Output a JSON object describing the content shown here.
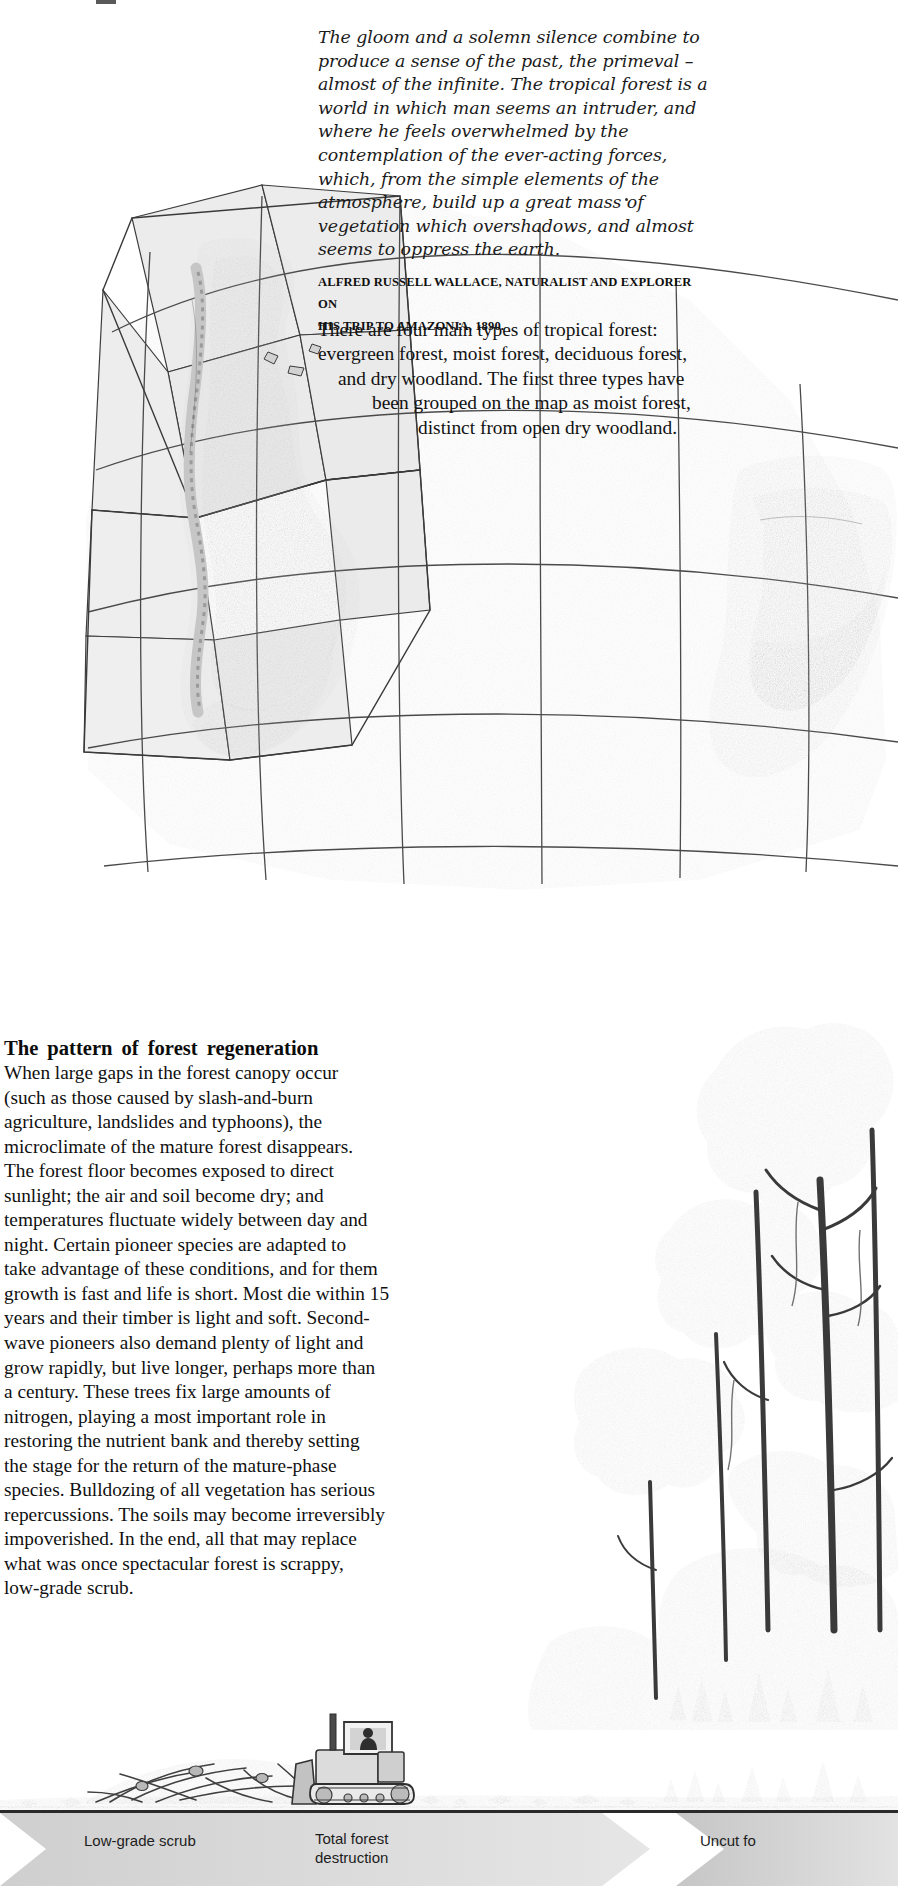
{
  "page": {
    "width": 898,
    "height": 1886,
    "background": "#ffffff"
  },
  "quote": {
    "text": "The gloom and a solemn silence combine to produce a sense of the past, the primeval – almost of the infinite. The tropical forest is a world in which man seems an intruder, and where he feels overwhelmed by the contemplation of the ever-acting forces, which, from the simple elements of the atmosphere, build up a great mass of vegetation which overshadows, and almost seems to oppress the earth.",
    "attribution_line1": "ALFRED RUSSELL WALLACE, NATURALIST AND EXPLORER ON",
    "attribution_line2": "HIS TRIP TO AMAZONIA, 1890."
  },
  "forest_types": {
    "line1": "There are four main types of tropical forest:",
    "line2": "evergreen forest, moist forest, deciduous forest,",
    "line3": "and dry woodland. The first three types have",
    "line4": "been grouped on the map as moist forest,",
    "line5": "distinct from open dry woodland."
  },
  "article": {
    "heading_words": [
      "The",
      "pattern",
      "of",
      "forest",
      "regeneration"
    ],
    "heading": "The pattern of forest regeneration",
    "body_lines": [
      "When large gaps in the forest canopy occur",
      "(such as those caused by slash-and-burn",
      "agriculture, landslides and typhoons), the",
      "microclimate of the mature forest disappears.",
      "The forest floor becomes exposed to direct",
      "sunlight; the air and soil become dry; and",
      "temperatures fluctuate widely between day and",
      "night. Certain pioneer species are adapted to",
      "take advantage of these conditions, and for them",
      "growth is fast and life is short. Most die within 15",
      "years and their timber is light and soft. Second-",
      "wave pioneers also demand plenty of light and",
      "grow rapidly, but live longer, perhaps more than",
      "a century. These trees fix large amounts of",
      "nitrogen, playing a most important role in",
      "restoring the nutrient bank and thereby setting",
      "the stage for the return of the mature-phase",
      "species. Bulldozing of all vegetation has serious",
      "repercussions. The soils may become irreversibly",
      "impoverished. In the end, all that may replace",
      "what was once spectacular forest is scrappy,",
      "low-grade scrub."
    ]
  },
  "caption_band": {
    "labels": {
      "low_grade_scrub": "Low-grade scrub",
      "total_forest_destruction_line1": "Total forest",
      "total_forest_destruction_line2": "destruction",
      "uncut_forest": "Uncut fo"
    }
  },
  "illustration": {
    "map_name": "tropical-forest-world-map",
    "trees_name": "rainforest-trees-illustration",
    "scene_name": "bulldozer-clearing-scene"
  },
  "colors": {
    "paper": "#ffffff",
    "map_ocean": "#ffffff",
    "map_land_light": "#e4e4e4",
    "map_land_mid": "#c9c9c9",
    "moist_forest": "#9c9c9c",
    "dry_woodland": "#bdbdbd",
    "graticule": "#4a4a4a",
    "text": "#101010",
    "band_rule": "#2a2a2a",
    "chevron_fill": "#d8d8d8"
  }
}
